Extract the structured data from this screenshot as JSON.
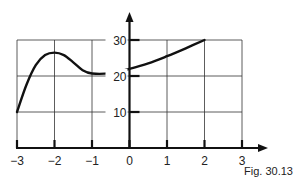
{
  "chart_data": {
    "type": "line",
    "title": "",
    "caption": "Fig. 30.13",
    "xlabel": "",
    "ylabel": "",
    "xlim": [
      -3,
      3
    ],
    "ylim": [
      0,
      30
    ],
    "grid": true,
    "x_ticks": [
      -3,
      -2,
      -1,
      0,
      1,
      2,
      3
    ],
    "x_tick_labels": [
      "−3",
      "−2",
      "−1",
      "0",
      "1",
      "2",
      "3"
    ],
    "y_ticks": [
      10,
      20,
      30
    ],
    "y_tick_labels": [
      "10",
      "20",
      "30"
    ],
    "series": [
      {
        "name": "curve",
        "x": [
          -3,
          -2.75,
          -2.5,
          -2.25,
          -2,
          -1.75,
          -1.5,
          -1.25,
          -1,
          -0.5,
          0,
          0.5,
          1,
          1.5,
          2
        ],
        "y": [
          10,
          17.5,
          23,
          25.8,
          26.5,
          25.8,
          23.8,
          21.6,
          20.7,
          20.8,
          22,
          23.5,
          25.5,
          27.7,
          30
        ]
      }
    ]
  }
}
